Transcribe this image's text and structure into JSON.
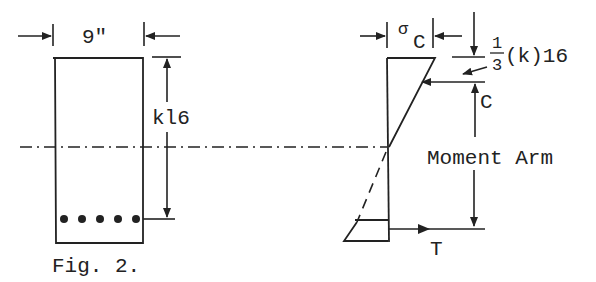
{
  "figure": {
    "caption": "Fig. 2.",
    "ink_color": "#222222",
    "background": "#ffffff"
  },
  "beam_section": {
    "width_label": "9\"",
    "depth_label": "kl6",
    "rebar_count": 5
  },
  "stress_diagram": {
    "stress_label_sigma": "σ",
    "stress_label_sub": "C",
    "lever_fraction_num": "1",
    "lever_fraction_den": "3",
    "lever_suffix": "(k)16",
    "compression_label": "C",
    "moment_arm_label": "Moment Arm",
    "tension_label": "T"
  }
}
